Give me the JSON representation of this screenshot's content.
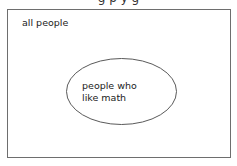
{
  "diagram": {
    "type": "venn",
    "caption_partial": "g  p  y  g",
    "universe": {
      "label": "all people"
    },
    "sets": [
      {
        "label_lines": [
          "people who",
          "like math"
        ]
      }
    ],
    "colors": {
      "stroke": "#5a5a5a",
      "background": "#ffffff",
      "text": "#222222"
    }
  }
}
